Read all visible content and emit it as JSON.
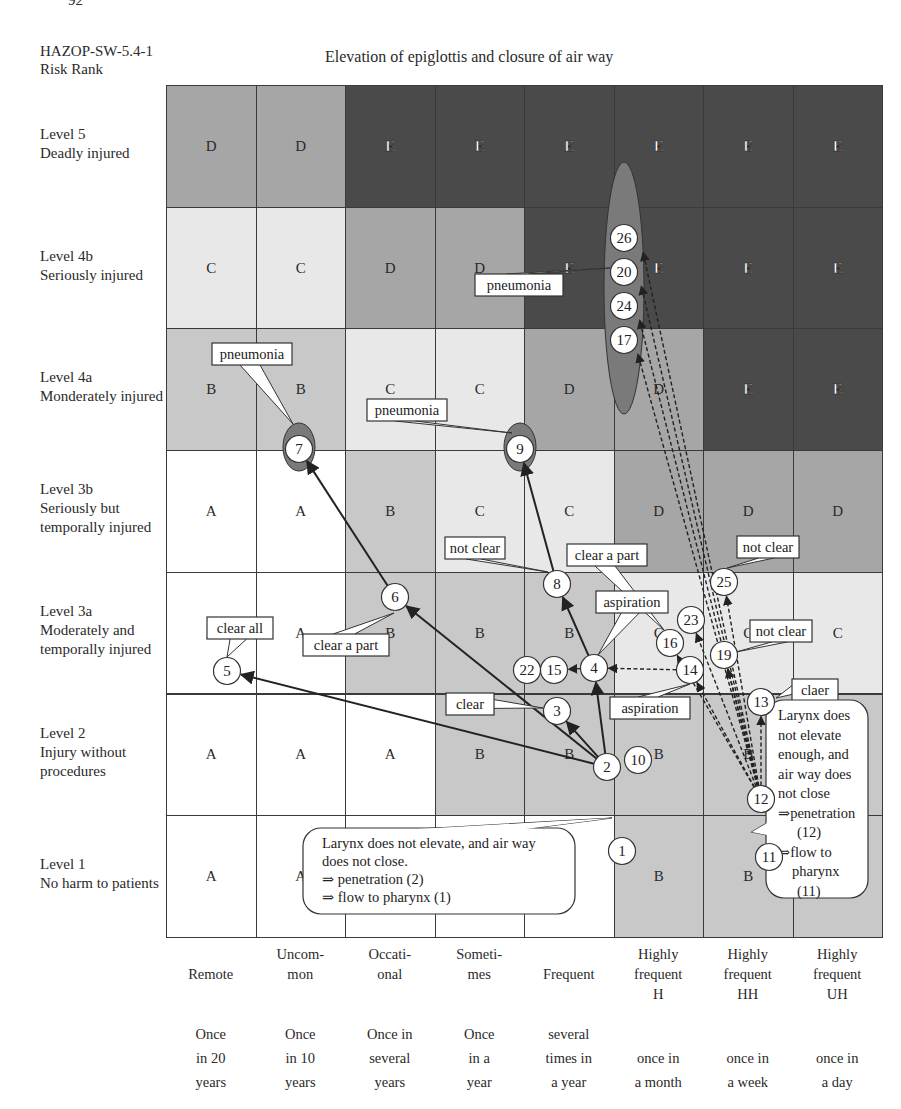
{
  "page": {
    "number": "92"
  },
  "header": {
    "doc_id_line1": "HAZOP-SW-5.4-1",
    "doc_id_line2": "Risk Rank",
    "title": "Elevation of epiglottis and closure of air way"
  },
  "colors": {
    "A": "#ffffff",
    "B": "#c8c8c8",
    "C": "#e8e8e8",
    "D": "#a6a6a6",
    "E": "#4a4a4a",
    "ellipse_fill": "#7a7a7a",
    "node_fill": "#ffffff",
    "line": "#222222"
  },
  "rows": [
    {
      "level": "Level 5",
      "desc": "Deadly injured",
      "desc2": ""
    },
    {
      "level": "Level 4b",
      "desc": "Seriously injured",
      "desc2": ""
    },
    {
      "level": "Level 4a",
      "desc": "Monderately injured",
      "desc2": ""
    },
    {
      "level": "Level 3b",
      "desc": "Seriously  but",
      "desc2": "temporally injured"
    },
    {
      "level": "Level 3a",
      "desc": "Moderately and",
      "desc2": "temporally injured"
    },
    {
      "level": "Level 2",
      "desc": "Injury without",
      "desc2": "procedures"
    },
    {
      "level": "Level 1",
      "desc": "No harm to patients",
      "desc2": ""
    }
  ],
  "columns": [
    {
      "freq": [
        "",
        "Remote",
        ""
      ],
      "period": [
        "Once",
        "in 20",
        "years"
      ]
    },
    {
      "freq": [
        "Uncom-",
        "mon",
        ""
      ],
      "period": [
        "Once",
        "in 10",
        "years"
      ]
    },
    {
      "freq": [
        "Occati-",
        "onal",
        ""
      ],
      "period": [
        "Once in",
        "several",
        "years"
      ]
    },
    {
      "freq": [
        "Someti-",
        "mes",
        ""
      ],
      "period": [
        "Once",
        "in a",
        "year"
      ]
    },
    {
      "freq": [
        "",
        "Frequent",
        ""
      ],
      "period": [
        "several",
        "times in",
        "a year"
      ]
    },
    {
      "freq": [
        "Highly",
        "frequent",
        "H"
      ],
      "period": [
        "",
        "once in",
        "a month"
      ]
    },
    {
      "freq": [
        "Highly",
        "frequent",
        "HH"
      ],
      "period": [
        "",
        "once in",
        "a week"
      ]
    },
    {
      "freq": [
        "Highly",
        "frequent",
        "UH"
      ],
      "period": [
        "",
        "once in",
        "a day"
      ]
    }
  ],
  "matrix": [
    [
      "D",
      "D",
      "E",
      "E",
      "E",
      "E",
      "E",
      "E"
    ],
    [
      "C",
      "C",
      "D",
      "D",
      "E",
      "E",
      "E",
      "E"
    ],
    [
      "B",
      "B",
      "C",
      "C",
      "D",
      "D",
      "E",
      "E"
    ],
    [
      "A",
      "A",
      "B",
      "C",
      "C",
      "D",
      "D",
      "D"
    ],
    [
      "A",
      "A",
      "B",
      "B",
      "B",
      "C",
      "C",
      "C"
    ],
    [
      "A",
      "A",
      "A",
      "B",
      "B",
      "B",
      "B",
      "B"
    ],
    [
      "A",
      "A",
      "A",
      "A",
      "A",
      "B",
      "B",
      "B"
    ]
  ],
  "nodes": [
    {
      "id": "1",
      "x": 622,
      "y": 851
    },
    {
      "id": "2",
      "x": 607,
      "y": 767
    },
    {
      "id": "3",
      "x": 557,
      "y": 711
    },
    {
      "id": "4",
      "x": 594,
      "y": 668
    },
    {
      "id": "5",
      "x": 227,
      "y": 671
    },
    {
      "id": "6",
      "x": 395,
      "y": 597
    },
    {
      "id": "7",
      "x": 299,
      "y": 449
    },
    {
      "id": "8",
      "x": 557,
      "y": 584
    },
    {
      "id": "9",
      "x": 520,
      "y": 449
    },
    {
      "id": "10",
      "x": 638,
      "y": 760
    },
    {
      "id": "11",
      "x": 769,
      "y": 857
    },
    {
      "id": "12",
      "x": 761,
      "y": 799
    },
    {
      "id": "13",
      "x": 761,
      "y": 702
    },
    {
      "id": "14",
      "x": 690,
      "y": 670
    },
    {
      "id": "15",
      "x": 554,
      "y": 670
    },
    {
      "id": "16",
      "x": 670,
      "y": 643
    },
    {
      "id": "17",
      "x": 624,
      "y": 340
    },
    {
      "id": "19",
      "x": 724,
      "y": 655
    },
    {
      "id": "20",
      "x": 624,
      "y": 272
    },
    {
      "id": "22",
      "x": 527,
      "y": 670
    },
    {
      "id": "23",
      "x": 691,
      "y": 620
    },
    {
      "id": "24",
      "x": 624,
      "y": 306
    },
    {
      "id": "25",
      "x": 724,
      "y": 582
    },
    {
      "id": "26",
      "x": 624,
      "y": 238
    }
  ],
  "callouts": {
    "pneumonia_top": "pneumonia",
    "pneumonia_7": "pneumonia",
    "pneumonia_9": "pneumonia",
    "not_clear_8": "not clear",
    "clear_a_part_16": "clear a part",
    "not_clear_25": "not clear",
    "aspiration_4": "aspiration",
    "not_clear_19": "not clear",
    "clear_all_5": "clear all",
    "clear_a_part_6": "clear a part",
    "clear_3": "clear",
    "aspiration_14": "aspiration",
    "claer_13": "claer",
    "bubble_left": [
      "Larynx does not elevate, and air way",
      "does not close.",
      "⇒ penetration (2)",
      "⇒ flow to pharynx (1)"
    ],
    "bubble_right": [
      "Larynx does",
      "not elevate",
      "enough, and",
      "air way does",
      "not close",
      "⇒penetration",
      "(12)",
      "⇒flow to",
      "pharynx",
      "(11)"
    ]
  }
}
